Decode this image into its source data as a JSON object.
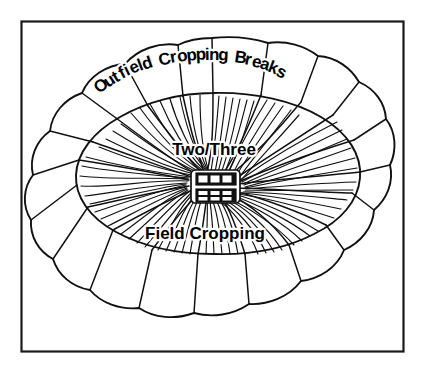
{
  "figure": {
    "type": "schematic-diagram",
    "background_color": "#ffffff",
    "line_color": "#111111",
    "frame": {
      "name": "border-frame",
      "stroke_color": "#1a1a1a",
      "x": 21,
      "y": 21,
      "width": 383,
      "height": 331
    }
  },
  "labels": {
    "outfield": {
      "text": "Outfield Cropping Breaks",
      "style": "curved-arc",
      "weight": "bold"
    },
    "two_three": {
      "text": "Two/Three",
      "style": "horizontal",
      "weight": "bold"
    },
    "field": {
      "text": "Field Cropping",
      "style": "horizontal",
      "weight": "bold"
    }
  },
  "curved_label_glyphs": {
    "outfield_cropping_breaks": [
      {
        "ch": "O",
        "x": 99,
        "y": 94,
        "rot": -37
      },
      {
        "ch": "u",
        "x": 108,
        "y": 88,
        "rot": -34
      },
      {
        "ch": "t",
        "x": 116,
        "y": 83,
        "rot": -31
      },
      {
        "ch": "f",
        "x": 122,
        "y": 79,
        "rot": -28
      },
      {
        "ch": "i",
        "x": 127,
        "y": 76,
        "rot": -26
      },
      {
        "ch": "e",
        "x": 132,
        "y": 74,
        "rot": -24
      },
      {
        "ch": "l",
        "x": 140,
        "y": 71,
        "rot": -21
      },
      {
        "ch": "d",
        "x": 144,
        "y": 70,
        "rot": -19
      },
      {
        "ch": "C",
        "x": 160,
        "y": 66,
        "rot": -14
      },
      {
        "ch": "r",
        "x": 171,
        "y": 63,
        "rot": -11
      },
      {
        "ch": "o",
        "x": 178,
        "y": 62,
        "rot": -9
      },
      {
        "ch": "p",
        "x": 187,
        "y": 61,
        "rot": -6
      },
      {
        "ch": "p",
        "x": 196,
        "y": 60,
        "rot": -3
      },
      {
        "ch": "i",
        "x": 205,
        "y": 60,
        "rot": -1
      },
      {
        "ch": "n",
        "x": 209,
        "y": 60,
        "rot": 1
      },
      {
        "ch": "g",
        "x": 218,
        "y": 60,
        "rot": 3
      },
      {
        "ch": "B",
        "x": 234,
        "y": 62,
        "rot": 8
      },
      {
        "ch": "r",
        "x": 244,
        "y": 64,
        "rot": 11
      },
      {
        "ch": "e",
        "x": 251,
        "y": 66,
        "rot": 14
      },
      {
        "ch": "a",
        "x": 259,
        "y": 68,
        "rot": 17
      },
      {
        "ch": "k",
        "x": 267,
        "y": 71,
        "rot": 21
      },
      {
        "ch": "s",
        "x": 275,
        "y": 75,
        "rot": 25
      }
    ]
  },
  "regions": {
    "outfield_ring": {
      "name": "outfield-cropping-breaks-ring",
      "description": "outer scalloped ring divided into radial cropping break wedges",
      "segment_count": 20
    },
    "infield": {
      "name": "infield-cropping-area",
      "description": "inner oval divided into hatched cropping sectors",
      "sector_count": 12
    },
    "homestead": {
      "name": "homestead-buildings",
      "description": "two solid building blocks at centre of the infield",
      "block_count": 2,
      "cells_per_block": 6
    }
  }
}
